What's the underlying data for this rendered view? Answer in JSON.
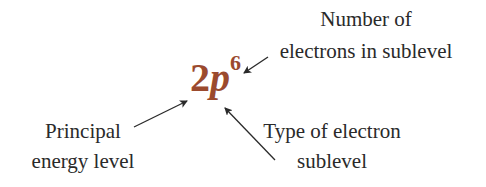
{
  "notation": {
    "level": "2",
    "sublevel": "p",
    "electrons": "6",
    "color": "#9b4a2e"
  },
  "labels": {
    "electron_count": {
      "line1": "Number of",
      "line2": "electrons in sublevel"
    },
    "principal_level": {
      "line1": "Principal",
      "line2": "energy level"
    },
    "sublevel_type": {
      "line1": "Type of electron",
      "line2": "sublevel"
    }
  }
}
